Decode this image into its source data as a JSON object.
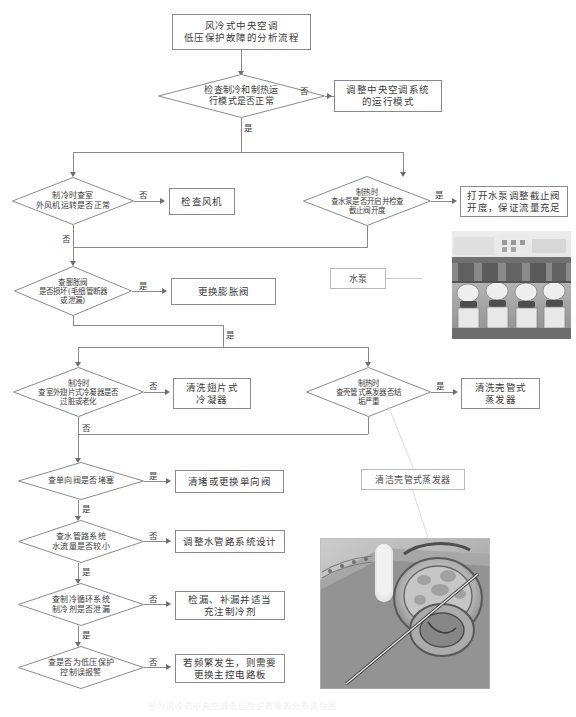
{
  "document": {
    "title": "风冷式中央空调低压保护故障的分析流程",
    "caption": "图为风冷式中央空调低压保护故障的分析流程图"
  },
  "flow": {
    "title_node": "风冷式中央空调\n低压保护故障的分析流程",
    "decisions": [
      {
        "id": "d1",
        "text": "检查制冷和制热运\n行模式是否正常"
      },
      {
        "id": "d2",
        "text": "制冷时查室\n外风机运转是否正常"
      },
      {
        "id": "d3",
        "text": "制热时\n查水泵是否开启并检查\n截止阀开度"
      },
      {
        "id": "d4",
        "text": "查膨胀阀\n是否损坏(毛细管断器\n或泄漏)"
      },
      {
        "id": "d5",
        "text": "制冷时\n查室外翅片式冷凝器是否\n过脏或老化"
      },
      {
        "id": "d6",
        "text": "制热时\n查壳管式蒸发器否结\n垢严重"
      },
      {
        "id": "d7",
        "text": "查单向阀是否堵塞"
      },
      {
        "id": "d8",
        "text": "查水管路系统\n水流量是否较小"
      },
      {
        "id": "d9",
        "text": "查制冷循环系统\n制冷剂是否泄漏"
      },
      {
        "id": "d10",
        "text": "查是否为低压保护\n控制误报警"
      }
    ],
    "actions": [
      {
        "id": "a1",
        "text": "调整中央空调系统\n的运行模式"
      },
      {
        "id": "a2",
        "text": "检查风机"
      },
      {
        "id": "a3",
        "text": "打开水泵调整截止阀\n开度，保证流量充足"
      },
      {
        "id": "a4",
        "text": "更换膨胀阀"
      },
      {
        "id": "a5",
        "text": "清洗翅片式\n冷凝器"
      },
      {
        "id": "a6",
        "text": "清洗壳管式\n蒸发器"
      },
      {
        "id": "a7",
        "text": "清堵或更换单向阀"
      },
      {
        "id": "a8",
        "text": "调整水管路系统设计"
      },
      {
        "id": "a9",
        "text": "检漏、补漏并适当\n充注制冷剂"
      },
      {
        "id": "a10",
        "text": "若频繁发生，则需要\n更换主控电路板"
      }
    ],
    "branch_labels": {
      "yes": "是",
      "no": "否"
    },
    "branches": [
      {
        "id": "b1",
        "label": "否"
      },
      {
        "id": "b2",
        "label": "是"
      },
      {
        "id": "b3",
        "label": "否"
      },
      {
        "id": "b4",
        "label": "是"
      },
      {
        "id": "b5",
        "label": "否"
      },
      {
        "id": "b6",
        "label": "是"
      },
      {
        "id": "b7",
        "label": "是"
      },
      {
        "id": "b8",
        "label": "否"
      },
      {
        "id": "b9",
        "label": "是"
      },
      {
        "id": "b10",
        "label": "否"
      },
      {
        "id": "b11",
        "label": "是"
      },
      {
        "id": "b12",
        "label": "是"
      },
      {
        "id": "b13",
        "label": "否"
      },
      {
        "id": "b14",
        "label": "是"
      },
      {
        "id": "b15",
        "label": "否"
      },
      {
        "id": "b16",
        "label": "是"
      },
      {
        "id": "b17",
        "label": "否"
      },
      {
        "id": "b18",
        "label": "是"
      }
    ]
  },
  "annotations": {
    "pump_label": "水泵",
    "evaporator_label": "清洁壳管式蒸发器"
  },
  "photos": [
    {
      "id": "pump-photo",
      "alt": "水泵机组照片"
    },
    {
      "id": "evaporator-photo",
      "alt": "壳管式蒸发器结垢照片"
    }
  ],
  "colors": {
    "stroke": "#8a8a8a",
    "text": "#3a3a3a",
    "arrow": "#6e6e6e"
  }
}
